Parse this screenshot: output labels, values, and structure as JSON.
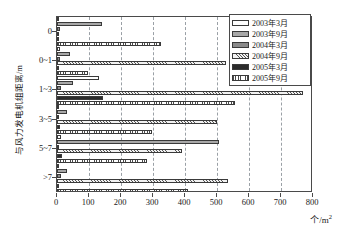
{
  "chart_data": {
    "type": "bar",
    "orientation": "horizontal",
    "title": "",
    "xlabel": "个/m²",
    "ylabel": "与风力发电机组距离/m",
    "categories": [
      "0",
      "0~1",
      "1~3",
      "3~5",
      "5~7",
      ">7"
    ],
    "xlim": [
      0,
      800
    ],
    "xticks": [
      0,
      100,
      200,
      300,
      400,
      500,
      600,
      700,
      800
    ],
    "grid": "vertical-dashed",
    "legend_position": "top-right",
    "series": [
      {
        "name": "2003年3月",
        "fill": "white",
        "values": [
          6,
          8,
          130,
          4,
          14,
          5
        ]
      },
      {
        "name": "2003年9月",
        "fill": "light-gray",
        "values": [
          142,
          42,
          50,
          30,
          505,
          30
        ]
      },
      {
        "name": "2004年3月",
        "fill": "medium-gray",
        "values": [
          10,
          10,
          12,
          6,
          4,
          12
        ]
      },
      {
        "name": "2004年9月",
        "fill": "diagonal-hatch",
        "values": [
          6,
          527,
          770,
          500,
          390,
          535
        ]
      },
      {
        "name": "2005年3月",
        "fill": "black",
        "values": [
          4,
          6,
          145,
          8,
          16,
          6
        ]
      },
      {
        "name": "2005年9月",
        "fill": "dotted-hatch",
        "values": [
          325,
          98,
          557,
          298,
          280,
          408
        ]
      }
    ]
  },
  "legend": {
    "items": [
      {
        "label": "2003年3月"
      },
      {
        "label": "2003年9月"
      },
      {
        "label": "2004年3月"
      },
      {
        "label": "2004年9月"
      },
      {
        "label": "2005年3月"
      },
      {
        "label": "2005年9月"
      }
    ]
  },
  "axes": {
    "x_tick_labels": [
      "0",
      "100",
      "200",
      "300",
      "400",
      "500",
      "600",
      "700",
      "800"
    ],
    "y_tick_labels": [
      "0",
      "0~1",
      "1~3",
      "3~5",
      "5~7",
      ">7"
    ],
    "x_title_text": "个/m",
    "x_title_sup": "2",
    "y_title": "与风力发电机组距离/m"
  }
}
